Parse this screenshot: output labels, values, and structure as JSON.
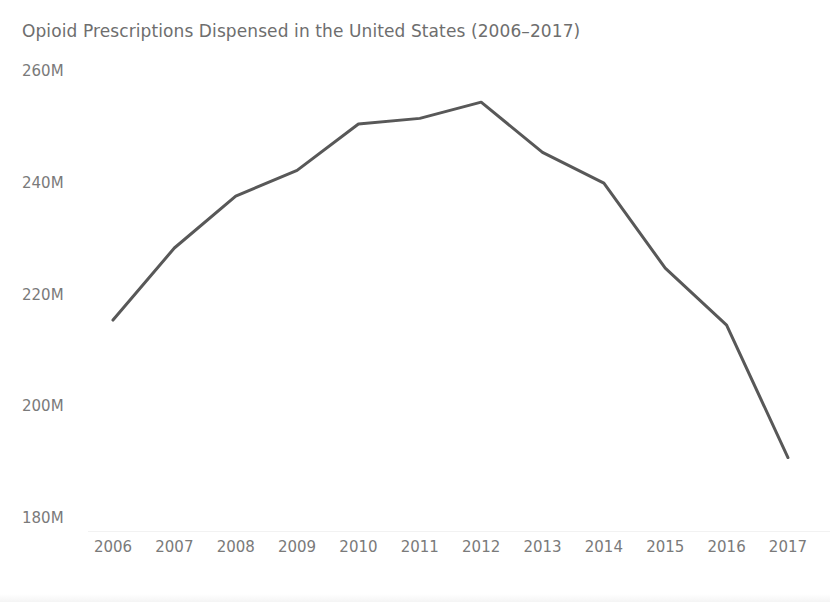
{
  "chart_data": {
    "type": "line",
    "title": "Opioid Prescriptions Dispensed in the United States (2006–2017)",
    "xlabel": "",
    "ylabel": "",
    "categories": [
      "2006",
      "2007",
      "2008",
      "2009",
      "2010",
      "2011",
      "2012",
      "2013",
      "2014",
      "2015",
      "2016",
      "2017"
    ],
    "x": [
      2006,
      2007,
      2008,
      2009,
      2010,
      2011,
      2012,
      2013,
      2014,
      2015,
      2016,
      2017
    ],
    "series": [
      {
        "name": "Opioid prescriptions dispensed",
        "units": "millions",
        "values": [
          215.6,
          228.5,
          237.8,
          242.4,
          250.7,
          251.7,
          254.6,
          245.6,
          240.1,
          224.9,
          214.7,
          191.0
        ]
      }
    ],
    "y_tick_labels": [
      "260M",
      "240M",
      "220M",
      "200M",
      "180M"
    ],
    "y_tick_values": [
      260,
      240,
      220,
      200,
      180
    ],
    "ylim": [
      180,
      260
    ],
    "xlim": [
      2006,
      2017
    ],
    "grid": false,
    "legend": false,
    "legend_position": "none",
    "line_color": "#585858",
    "line_width": 3,
    "markers": false,
    "axis_label_color": "#7a7a7a",
    "title_color": "#6e6e6e",
    "background_color": "#ffffff"
  },
  "layout": {
    "plot_left": 88,
    "plot_right": 812,
    "plot_top": 72,
    "plot_bottom": 519,
    "x_first_px": 113,
    "x_step_px": 61.36,
    "y_top_value": 260,
    "y_bottom_value": 180,
    "y_top_px": 72,
    "y_bottom_px": 519
  }
}
